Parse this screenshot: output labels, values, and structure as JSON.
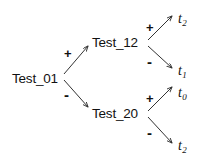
{
  "diagram": {
    "type": "binary-decision-tree",
    "title": "",
    "background_color": "#ffffff",
    "stroke_color": "#333333",
    "text_color": "#111111",
    "nodes": [
      {
        "id": "root",
        "label": "Test_01",
        "kind": "test",
        "x": 12,
        "y": 72
      },
      {
        "id": "upper",
        "label": "Test_12",
        "kind": "test",
        "x": 92,
        "y": 36
      },
      {
        "id": "lower",
        "label": "Test_20",
        "kind": "test",
        "x": 92,
        "y": 107
      }
    ],
    "leaves": [
      {
        "id": "leaf-t2-top",
        "symbol": "t",
        "subscript": "2",
        "x": 178,
        "y": 12
      },
      {
        "id": "leaf-t1",
        "symbol": "t",
        "subscript": "1",
        "x": 178,
        "y": 64
      },
      {
        "id": "leaf-t0",
        "symbol": "t",
        "subscript": "0",
        "x": 178,
        "y": 86
      },
      {
        "id": "leaf-t2-bottom",
        "symbol": "t",
        "subscript": "2",
        "x": 178,
        "y": 139
      }
    ],
    "edges": [
      {
        "id": "edge-root-upper",
        "from": "root",
        "to": "upper",
        "sign": "+",
        "sign_x": 64,
        "sign_y": 47
      },
      {
        "id": "edge-root-lower",
        "from": "root",
        "to": "lower",
        "sign": "-",
        "sign_x": 64,
        "sign_y": 87
      },
      {
        "id": "edge-upper-t2",
        "from": "upper",
        "to": "leaf-t2-top",
        "sign": "+",
        "sign_x": 146,
        "sign_y": 21
      },
      {
        "id": "edge-upper-t1",
        "from": "upper",
        "to": "leaf-t1",
        "sign": "-",
        "sign_x": 147,
        "sign_y": 54
      },
      {
        "id": "edge-lower-t0",
        "from": "lower",
        "to": "leaf-t0",
        "sign": "+",
        "sign_x": 146,
        "sign_y": 92
      },
      {
        "id": "edge-lower-t2",
        "from": "lower",
        "to": "leaf-t2-bottom",
        "sign": "-",
        "sign_x": 147,
        "sign_y": 125
      }
    ]
  }
}
